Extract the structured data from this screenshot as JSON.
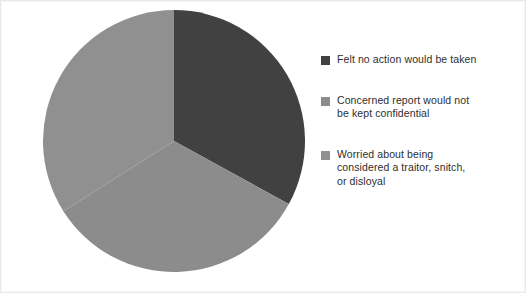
{
  "chart_data": {
    "type": "pie",
    "title": "",
    "subtitle": "",
    "xlabel": "",
    "ylabel": "",
    "grid": false,
    "legend_position": "right",
    "start_angle_deg": 0,
    "direction": "clockwise",
    "categories": [
      "Felt no action would be taken",
      "Concerned report would not be kept confidential",
      "Worried about being considered a traitor, snitch, or disloyal"
    ],
    "values": [
      33,
      33,
      34
    ],
    "slices": [
      {
        "label": "Felt no action would be taken",
        "value": 33,
        "color": "#414141",
        "start_deg": 0,
        "end_deg": 118.8
      },
      {
        "label": "Concerned report would not be kept confidential",
        "value": 33,
        "color": "#8c8c8c",
        "start_deg": 118.8,
        "end_deg": 237.6
      },
      {
        "label": "Worried about being considered a traitor, snitch, or disloyal",
        "value": 34,
        "color": "#909090",
        "start_deg": 237.6,
        "end_deg": 360
      }
    ]
  },
  "pie": {
    "center_x": 131,
    "center_y": 131,
    "radius": 131
  },
  "legend": {
    "entries": [
      {
        "label": "Felt no action would be taken",
        "color": "#414141"
      },
      {
        "label": "Concerned report would not\nbe kept confidential",
        "color": "#8c8c8c"
      },
      {
        "label": "Worried about being\nconsidered a traitor, snitch,\nor disloyal",
        "color": "#909090"
      }
    ]
  },
  "colors": {
    "background": "#ffffff",
    "frame": "#e9e9e9",
    "text": "#2e2e2e",
    "slice_dark": "#414141",
    "slice_mid": "#8c8c8c",
    "slice_light": "#909090"
  }
}
